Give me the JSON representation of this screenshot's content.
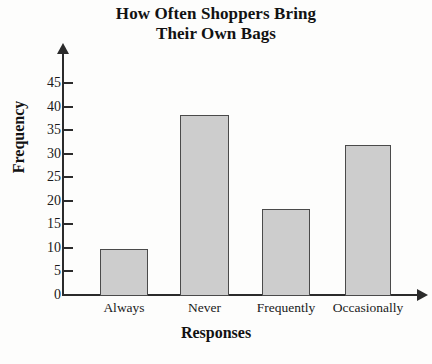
{
  "chart_data": {
    "type": "bar",
    "title": "How Often Shoppers Bring Their Own Bags",
    "title_lines": [
      "How Often Shoppers Bring",
      "Their Own Bags"
    ],
    "categories": [
      "Always",
      "Never",
      "Frequently",
      "Occasionally"
    ],
    "values": [
      10,
      38.5,
      18.5,
      32
    ],
    "xlabel": "Responses",
    "ylabel": "Frequency",
    "ylim": [
      0,
      47
    ],
    "yticks": [
      0,
      5,
      10,
      15,
      20,
      25,
      30,
      35,
      40,
      45
    ],
    "ytick_labels": [
      "0",
      "5",
      "10",
      "15",
      "20",
      "25",
      "30",
      "35",
      "40",
      "45"
    ],
    "grid": false,
    "legend": null,
    "bar_fill_color": "#cdcdcd",
    "bar_border_color": "#4a4a4a",
    "axis_color": "#2b2b2b",
    "background_color": "#fdfdfc"
  }
}
